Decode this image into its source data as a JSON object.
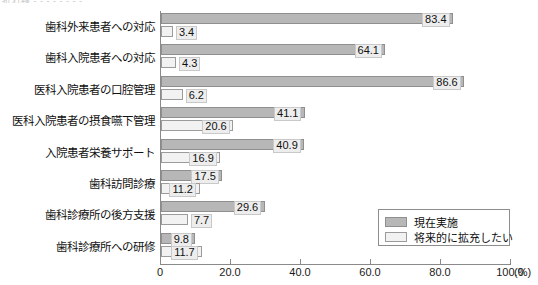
{
  "artifact": {
    "top_text": "折れ線 - - - - - - - -"
  },
  "chart_data": {
    "type": "bar",
    "orientation": "horizontal",
    "title": "",
    "xlabel": "(%)",
    "ylabel": "",
    "xlim": [
      0,
      100
    ],
    "grid": false,
    "legend_position": "bottom-right",
    "categories": [
      "歯科外来患者への対応",
      "歯科入院患者への対応",
      "医科入院患者の口腔管理",
      "医科入院患者の摂食嚥下管理",
      "入院患者栄養サポート",
      "歯科訪問診療",
      "歯科診療所の後方支援",
      "歯科診療所への研修"
    ],
    "series": [
      {
        "name": "現在実施",
        "color": "#b7b7b7",
        "values": [
          83.4,
          64.1,
          86.6,
          41.1,
          40.9,
          17.5,
          29.6,
          9.8
        ],
        "labels": [
          "83.4",
          "64.1",
          "86.6",
          "41.1",
          "40.9",
          "17.5",
          "29.6",
          "9.8"
        ]
      },
      {
        "name": "将来的に拡充したい",
        "color": "#f2f2f2",
        "values": [
          3.4,
          4.3,
          6.2,
          20.6,
          16.9,
          11.2,
          7.7,
          11.7
        ],
        "labels": [
          "3.4",
          "4.3",
          "6.2",
          "20.6",
          "16.9",
          "11.2",
          "7.7",
          "11.7"
        ]
      }
    ],
    "xticks": [
      0,
      20,
      40,
      60,
      80,
      100
    ],
    "xtick_labels": [
      "0",
      "20.0",
      "40.0",
      "60.0",
      "80.0",
      "100.0"
    ],
    "unit": "(%)"
  }
}
